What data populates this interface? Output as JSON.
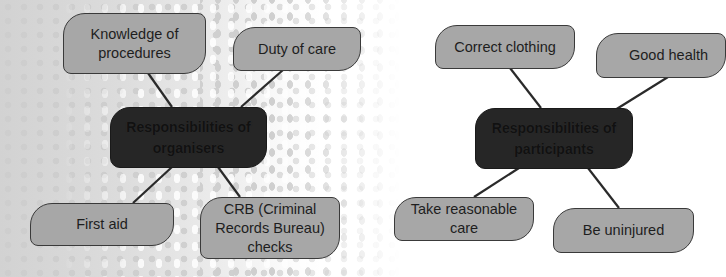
{
  "diagrams": [
    {
      "title": "Responsibilities of organisers",
      "center": {
        "label": "Responsibilities of\norganisers"
      },
      "nodes": [
        {
          "label": "Knowledge of\nprocedures"
        },
        {
          "label": "Duty of care"
        },
        {
          "label": "First aid"
        },
        {
          "label": "CRB (Criminal\nRecords Bureau)\nchecks"
        }
      ]
    },
    {
      "title": "Responsibilities of participants",
      "center": {
        "label": "Responsibilities of\nparticipants"
      },
      "nodes": [
        {
          "label": "Correct clothing"
        },
        {
          "label": "Good health"
        },
        {
          "label": "Take reasonable\ncare"
        },
        {
          "label": "Be uninjured"
        }
      ]
    }
  ],
  "colors": {
    "node_fill": "#a7a7a7",
    "node_border": "#3a3a3a",
    "center_fill": "#262626",
    "connector": "#2a2a2a"
  }
}
